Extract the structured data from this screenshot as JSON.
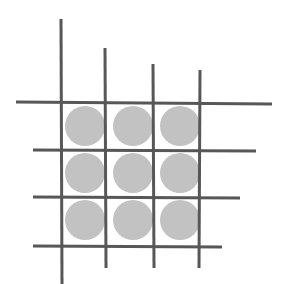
{
  "canvas": {
    "width": 288,
    "height": 284,
    "background_color": "#ffffff",
    "description": "Hand-drawn style tic-tac-toe grid of four vertical and four horizontal lines with nine gray filled circles arranged in a 3 by 3 grid inside the cells"
  },
  "style": {
    "line_color": "#575757",
    "line_width": 3,
    "circle_fill": "#c2c2c2",
    "circle_stroke": "none",
    "circle_diameter": 40
  },
  "figure": {
    "vertical_lines": [
      {
        "name": "vertical-line-1",
        "x1": 61,
        "y1": 19,
        "x2": 62,
        "y2": 284
      },
      {
        "name": "vertical-line-2",
        "x1": 105,
        "y1": 48,
        "x2": 106,
        "y2": 268
      },
      {
        "name": "vertical-line-3",
        "x1": 153,
        "y1": 64,
        "x2": 154,
        "y2": 268
      },
      {
        "name": "vertical-line-4",
        "x1": 200,
        "y1": 70,
        "x2": 199,
        "y2": 268
      }
    ],
    "horizontal_lines": [
      {
        "name": "horizontal-line-1",
        "x1": 16,
        "y1": 102,
        "x2": 272,
        "y2": 104
      },
      {
        "name": "horizontal-line-2",
        "x1": 33,
        "y1": 150,
        "x2": 256,
        "y2": 151
      },
      {
        "name": "horizontal-line-3",
        "x1": 33,
        "y1": 197,
        "x2": 240,
        "y2": 198
      },
      {
        "name": "horizontal-line-4",
        "x1": 33,
        "y1": 246,
        "x2": 222,
        "y2": 247
      }
    ],
    "circles": [
      {
        "name": "circle-row1-col1",
        "cx": 85,
        "cy": 126,
        "r": 20,
        "row": 1,
        "col": 1
      },
      {
        "name": "circle-row1-col2",
        "cx": 133,
        "cy": 126,
        "r": 20,
        "row": 1,
        "col": 2
      },
      {
        "name": "circle-row1-col3",
        "cx": 180,
        "cy": 126,
        "r": 20,
        "row": 1,
        "col": 3
      },
      {
        "name": "circle-row2-col1",
        "cx": 85,
        "cy": 173,
        "r": 20,
        "row": 2,
        "col": 1
      },
      {
        "name": "circle-row2-col2",
        "cx": 133,
        "cy": 173,
        "r": 20,
        "row": 2,
        "col": 2
      },
      {
        "name": "circle-row2-col3",
        "cx": 180,
        "cy": 173,
        "r": 20,
        "row": 2,
        "col": 3
      },
      {
        "name": "circle-row3-col1",
        "cx": 85,
        "cy": 220,
        "r": 20,
        "row": 3,
        "col": 1
      },
      {
        "name": "circle-row3-col2",
        "cx": 133,
        "cy": 220,
        "r": 20,
        "row": 3,
        "col": 2
      },
      {
        "name": "circle-row3-col3",
        "cx": 180,
        "cy": 220,
        "r": 20,
        "row": 3,
        "col": 3
      }
    ]
  }
}
